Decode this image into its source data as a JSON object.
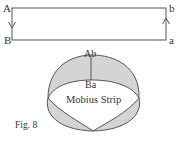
{
  "figure": {
    "caption": "Fig. 8",
    "colors": {
      "stroke": "#555555",
      "fill": "#d4d4d4",
      "text": "#333333",
      "background": "#ffffff"
    },
    "rectangle": {
      "corner_labels": {
        "top_left": "A",
        "bottom_left": "B",
        "top_right": "b",
        "bottom_right": "a"
      },
      "arrows": {
        "left_edge": "down",
        "right_edge": "up"
      }
    },
    "mobius": {
      "title": "Mobius Strip",
      "top_label": "Ab",
      "bottom_label": "Ba"
    }
  }
}
